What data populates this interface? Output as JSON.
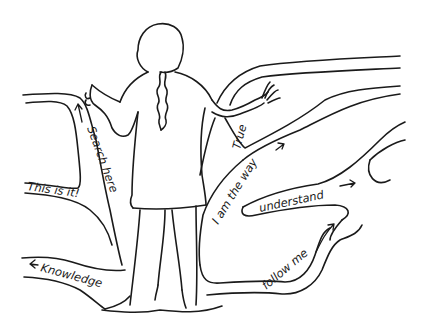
{
  "illustration": {
    "subject": "figure standing at base of branching paths",
    "background_color": "#ffffff",
    "ink_color": "#1a1a1a",
    "labels": {
      "search_here": "Search here",
      "this_is_it": "This is it!",
      "knowledge": "Knowledge",
      "true": "True",
      "i_am_the_way": "I am the way",
      "understand": "understand",
      "follow_me": "follow me"
    }
  }
}
